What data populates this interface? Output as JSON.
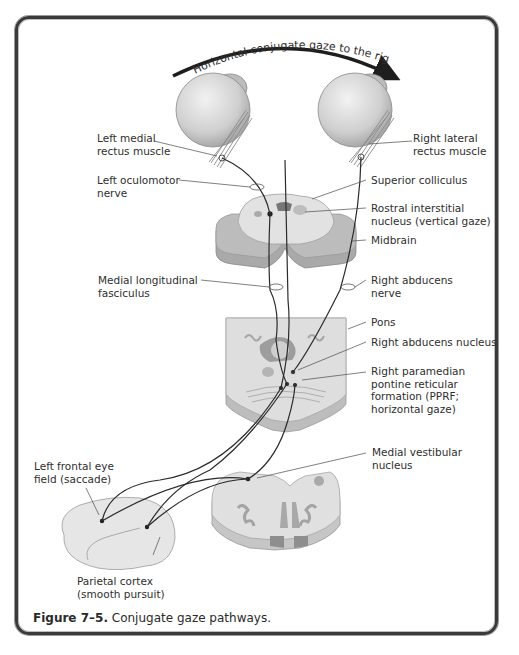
{
  "figure": {
    "title_arc": "Horizontal conjugate gaze to the right",
    "caption_number": "Figure 7–5.",
    "caption_text": "Conjugate gaze pathways."
  },
  "labels": {
    "left_medial_rectus": "Left medial\nrectus muscle",
    "right_lateral_rectus": "Right lateral\nrectus muscle",
    "left_oculomotor_nerve": "Left oculomotor\nnerve",
    "superior_colliculus": "Superior colliculus",
    "rostral_interstitial_nucleus": "Rostral interstitial\nnucleus (vertical gaze)",
    "midbrain": "Midbrain",
    "medial_longitudinal_fasciculus": "Medial longitudinal\nfasciculus",
    "right_abducens_nerve": "Right abducens\nnerve",
    "pons": "Pons",
    "right_abducens_nucleus": "Right abducens nucleus",
    "right_pprf": "Right paramedian\npontine reticular\nformation (PPRF;\nhorizontal gaze)",
    "medial_vestibular_nucleus": "Medial vestibular\nnucleus",
    "left_frontal_eye_field": "Left frontal eye\nfield (saccade)",
    "parietal_cortex": "Parietal cortex\n(smooth pursuit)"
  },
  "colors": {
    "frame": "#3a3a3a",
    "eye": "#d4d4d4",
    "tissue_light": "#dcdcdc",
    "tissue_dark": "#9e9e9e",
    "nucleus": "#8c8c8c",
    "pathway": "#2b2b2b"
  }
}
